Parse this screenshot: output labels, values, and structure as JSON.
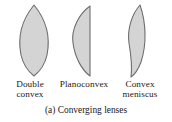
{
  "figure": {
    "caption": "(a) Converging lenses",
    "background_color": "#ffffff",
    "lens_fill_color": "#d4d4d4",
    "lens_outline_color": "#6e6e6e",
    "text_color": "#1a1a1a"
  },
  "lenses": [
    {
      "name": "double-convex",
      "label_line1": "Double",
      "label_line2": "convex",
      "shape": "biconvex",
      "surfaces": [
        "convex",
        "convex"
      ]
    },
    {
      "name": "planoconvex",
      "label_line1": "Planoconvex",
      "label_line2": "",
      "shape": "plano-convex",
      "surfaces": [
        "convex",
        "plane"
      ]
    },
    {
      "name": "convex-meniscus",
      "label_line1": "Convex",
      "label_line2": "meniscus",
      "shape": "meniscus",
      "surfaces": [
        "concave",
        "convex"
      ]
    }
  ]
}
